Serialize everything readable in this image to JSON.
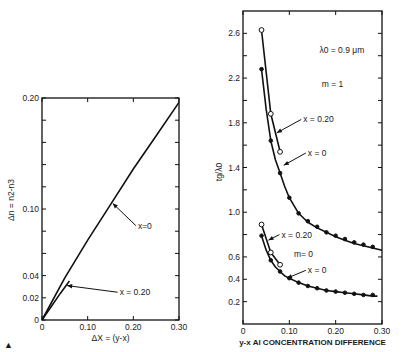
{
  "figure": {
    "marker": "▲"
  },
  "chart_data": [
    {
      "id": "left",
      "type": "line",
      "title": "",
      "xlabel": "ΔX = (y-x)",
      "ylabel": "Δn = n2-n3",
      "xlim": [
        0,
        0.3
      ],
      "ylim": [
        0,
        0.2
      ],
      "xticks": [
        0,
        0.1,
        0.2,
        0.3
      ],
      "xtick_labels": [
        "0",
        "0.10",
        "0.20",
        "0.30"
      ],
      "yticks": [
        0,
        0.02,
        0.04,
        0.1,
        0.2
      ],
      "ytick_labels": [
        "0",
        "0.02",
        "0.04",
        "0.10",
        "0.20"
      ],
      "minor_yticks": [
        0.06,
        0.08,
        0.12,
        0.14,
        0.16,
        0.18
      ],
      "grid": false,
      "series": [
        {
          "name": "x=0",
          "x": [
            0,
            0.05,
            0.1,
            0.15,
            0.2,
            0.25,
            0.3
          ],
          "y": [
            0,
            0.038,
            0.072,
            0.104,
            0.136,
            0.166,
            0.196
          ]
        },
        {
          "name": "x=0.20",
          "x": [
            0,
            0.02,
            0.04,
            0.06
          ],
          "y": [
            0,
            0.012,
            0.024,
            0.035
          ]
        }
      ],
      "annotations": [
        {
          "text": "x=0",
          "x": 0.21,
          "y": 0.085,
          "arrow_to": [
            0.155,
            0.105
          ]
        },
        {
          "text": "x = 0.20",
          "x": 0.17,
          "y": 0.025,
          "arrow_to": [
            0.055,
            0.031
          ]
        }
      ]
    },
    {
      "id": "right",
      "type": "line",
      "title": "",
      "xlabel": "y-x  Al  CONCENTRATION  DIFFERENCE",
      "ylabel": "tg/λ0",
      "xlim": [
        0,
        0.3
      ],
      "ylim": [
        0,
        2.8
      ],
      "xticks": [
        0,
        0.1,
        0.2,
        0.3
      ],
      "xtick_labels": [
        "0",
        "0.10",
        "0.20",
        "0.30"
      ],
      "yticks": [
        0.2,
        0.4,
        0.6,
        1.0,
        1.4,
        1.8,
        2.2,
        2.6
      ],
      "ytick_labels": [
        "0.2",
        "0.4",
        "0.6",
        "1.0",
        "1.4",
        "1.8",
        "2.2",
        "2.6"
      ],
      "minor_yticks": [
        0.8,
        1.2,
        1.6,
        2.0,
        2.4
      ],
      "grid": false,
      "series": [
        {
          "name": "m=1, x=0.20",
          "marker": "open-circle",
          "x": [
            0.04,
            0.06,
            0.08
          ],
          "y": [
            2.63,
            1.88,
            1.54
          ]
        },
        {
          "name": "m=1, x=0",
          "marker": "filled-circle",
          "x": [
            0.04,
            0.06,
            0.08,
            0.1,
            0.12,
            0.14,
            0.16,
            0.18,
            0.2,
            0.22,
            0.24,
            0.26,
            0.28
          ],
          "y": [
            2.28,
            1.64,
            1.35,
            1.13,
            0.99,
            0.92,
            0.87,
            0.82,
            0.79,
            0.76,
            0.73,
            0.71,
            0.69
          ],
          "curve": [
            [
              0.04,
              2.28
            ],
            [
              0.05,
              1.92
            ],
            [
              0.06,
              1.64
            ],
            [
              0.07,
              1.47
            ],
            [
              0.08,
              1.35
            ],
            [
              0.09,
              1.23
            ],
            [
              0.1,
              1.13
            ],
            [
              0.12,
              0.99
            ],
            [
              0.14,
              0.91
            ],
            [
              0.16,
              0.86
            ],
            [
              0.18,
              0.82
            ],
            [
              0.2,
              0.78
            ],
            [
              0.22,
              0.75
            ],
            [
              0.24,
              0.72
            ],
            [
              0.26,
              0.7
            ],
            [
              0.28,
              0.68
            ],
            [
              0.3,
              0.66
            ]
          ]
        },
        {
          "name": "m=0, x=0.20",
          "marker": "open-circle",
          "x": [
            0.04,
            0.06,
            0.08
          ],
          "y": [
            0.89,
            0.64,
            0.53
          ]
        },
        {
          "name": "m=0, x=0",
          "marker": "filled-circle",
          "x": [
            0.04,
            0.06,
            0.08,
            0.1,
            0.12,
            0.14,
            0.16,
            0.18,
            0.2,
            0.22,
            0.24,
            0.26,
            0.28
          ],
          "y": [
            0.79,
            0.57,
            0.47,
            0.41,
            0.37,
            0.34,
            0.32,
            0.3,
            0.29,
            0.28,
            0.27,
            0.26,
            0.26
          ],
          "curve": [
            [
              0.04,
              0.79
            ],
            [
              0.05,
              0.66
            ],
            [
              0.06,
              0.57
            ],
            [
              0.07,
              0.51
            ],
            [
              0.08,
              0.47
            ],
            [
              0.09,
              0.43
            ],
            [
              0.1,
              0.41
            ],
            [
              0.12,
              0.37
            ],
            [
              0.14,
              0.34
            ],
            [
              0.16,
              0.32
            ],
            [
              0.18,
              0.3
            ],
            [
              0.2,
              0.29
            ],
            [
              0.22,
              0.28
            ],
            [
              0.24,
              0.27
            ],
            [
              0.26,
              0.26
            ],
            [
              0.28,
              0.25
            ],
            [
              0.29,
              0.25
            ]
          ]
        }
      ],
      "annotations": [
        {
          "text": "λ0 = 0.9 μm",
          "x": 0.165,
          "y": 2.45
        },
        {
          "text": "m = 1",
          "x": 0.17,
          "y": 2.15
        },
        {
          "text": "x = 0.20",
          "x": 0.13,
          "y": 1.83,
          "arrow_to": [
            0.073,
            1.71
          ]
        },
        {
          "text": "x = 0",
          "x": 0.14,
          "y": 1.53,
          "arrow_to": [
            0.088,
            1.42
          ]
        },
        {
          "text": "x = 0.20",
          "x": 0.083,
          "y": 0.8,
          "arrow_to": [
            0.055,
            0.75
          ]
        },
        {
          "text": "m= 0",
          "x": 0.11,
          "y": 0.63
        },
        {
          "text": "x = 0",
          "x": 0.14,
          "y": 0.48,
          "arrow_to": [
            0.095,
            0.41
          ]
        }
      ]
    }
  ]
}
